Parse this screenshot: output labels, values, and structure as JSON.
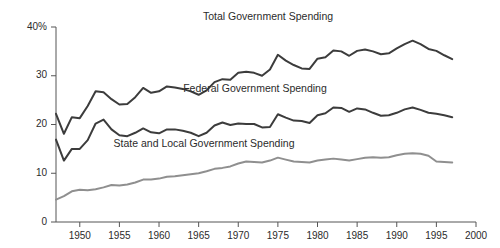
{
  "chart_data": {
    "type": "line",
    "title": "",
    "subtitle": "",
    "xlabel": "",
    "ylabel": "",
    "xlim": [
      1947,
      2000
    ],
    "ylim": [
      0,
      40
    ],
    "grid": false,
    "legend_position": "inline-annotation",
    "x_tick_labels": [
      "1950",
      "1955",
      "1960",
      "1965",
      "1970",
      "1975",
      "1980",
      "1985",
      "1990",
      "1995",
      "2000"
    ],
    "x_ticks": [
      1950,
      1955,
      1960,
      1965,
      1970,
      1975,
      1980,
      1985,
      1990,
      1995,
      2000
    ],
    "y_tick_labels": [
      "0",
      "10",
      "20",
      "30",
      "40%"
    ],
    "y_ticks": [
      0,
      10,
      20,
      30,
      40
    ],
    "x": [
      1947,
      1948,
      1949,
      1950,
      1951,
      1952,
      1953,
      1954,
      1955,
      1956,
      1957,
      1958,
      1959,
      1960,
      1961,
      1962,
      1963,
      1964,
      1965,
      1966,
      1967,
      1968,
      1969,
      1970,
      1971,
      1972,
      1973,
      1974,
      1975,
      1976,
      1977,
      1978,
      1979,
      1980,
      1981,
      1982,
      1983,
      1984,
      1985,
      1986,
      1987,
      1988,
      1989,
      1990,
      1991,
      1992,
      1993,
      1994,
      1995,
      1996,
      1997
    ],
    "series": [
      {
        "name": "Total Government Spending",
        "color": "#3c3c3c",
        "line_width": 2.0,
        "values": [
          22.2,
          18.1,
          21.5,
          21.3,
          23.8,
          26.8,
          26.6,
          25.2,
          24.1,
          24.2,
          25.6,
          27.5,
          26.5,
          26.8,
          27.8,
          27.6,
          27.3,
          26.8,
          26.1,
          27.0,
          28.7,
          29.3,
          29.2,
          30.6,
          30.8,
          30.6,
          30.0,
          31.3,
          34.3,
          33.1,
          32.2,
          31.5,
          31.4,
          33.5,
          33.8,
          35.2,
          35.0,
          34.1,
          35.1,
          35.4,
          35.0,
          34.4,
          34.6,
          35.6,
          36.5,
          37.2,
          36.5,
          35.5,
          35.1,
          34.2,
          33.4
        ]
      },
      {
        "name": "Federal Government Spending",
        "color": "#3c3c3c",
        "line_width": 2.0,
        "values": [
          16.9,
          12.6,
          15.0,
          15.0,
          16.8,
          20.2,
          21.0,
          19.0,
          17.8,
          17.6,
          18.3,
          19.2,
          18.4,
          18.2,
          19.0,
          19.0,
          18.7,
          18.3,
          17.6,
          18.3,
          19.8,
          20.4,
          19.9,
          20.2,
          20.1,
          20.1,
          19.4,
          19.5,
          22.1,
          21.4,
          20.8,
          20.7,
          20.3,
          21.9,
          22.3,
          23.5,
          23.4,
          22.6,
          23.3,
          23.1,
          22.4,
          21.8,
          21.9,
          22.4,
          23.1,
          23.5,
          23.0,
          22.4,
          22.2,
          21.9,
          21.5
        ]
      },
      {
        "name": "State and Local Government Spending",
        "color": "#8f8f8f",
        "line_width": 2.0,
        "values": [
          4.6,
          5.3,
          6.3,
          6.6,
          6.5,
          6.7,
          7.1,
          7.6,
          7.5,
          7.7,
          8.1,
          8.7,
          8.7,
          8.9,
          9.3,
          9.4,
          9.6,
          9.8,
          10.0,
          10.4,
          10.9,
          11.1,
          11.4,
          12.0,
          12.4,
          12.3,
          12.2,
          12.6,
          13.2,
          12.8,
          12.4,
          12.3,
          12.2,
          12.6,
          12.8,
          13.0,
          12.8,
          12.6,
          12.9,
          13.2,
          13.3,
          13.2,
          13.3,
          13.7,
          14.0,
          14.1,
          14.0,
          13.6,
          12.4,
          12.3,
          12.2
        ]
      }
    ],
    "annotations": [
      {
        "text": "Total Government Spending",
        "x_px": 268,
        "y_px": 20
      },
      {
        "text": "Federal Government Spending",
        "x_px": 255,
        "y_px": 92
      },
      {
        "text": "State and Local Government Spending",
        "x_px": 204,
        "y_px": 147
      }
    ]
  }
}
